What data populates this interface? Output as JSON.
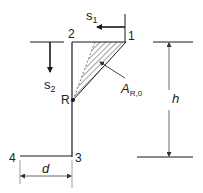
{
  "diagram": {
    "points": [
      {
        "id": "p1",
        "label": "1"
      },
      {
        "id": "p2",
        "label": "2"
      },
      {
        "id": "p3",
        "label": "3"
      },
      {
        "id": "p4",
        "label": "4"
      },
      {
        "id": "pR",
        "label": "R"
      }
    ],
    "displacements": {
      "s1": {
        "base": "s",
        "sub": "1"
      },
      "s2": {
        "base": "s",
        "sub": "2"
      }
    },
    "area": {
      "base": "A",
      "sub": "R,0"
    },
    "dimensions": {
      "height": "h",
      "width": "d"
    },
    "colors": {
      "line": "#1a1a1a",
      "light_line": "#888888"
    }
  }
}
